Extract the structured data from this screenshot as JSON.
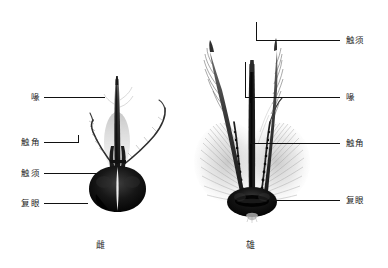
{
  "figure": {
    "type": "anatomical-comparison-diagram",
    "background_color": "#ffffff",
    "line_color": "#111111",
    "text_color": "#1c1c1c"
  },
  "female_panel": {
    "caption": "雌",
    "labels": [
      {
        "text": "喙",
        "meaning": "proboscis",
        "y": 97,
        "text_x": 14,
        "line_x1": 44,
        "line_x2": 105
      },
      {
        "text": "触角",
        "meaning": "antenna",
        "y": 142,
        "text_x": 8,
        "line_x1": 44,
        "line_x2": 78
      },
      {
        "text": "触须",
        "meaning": "palp",
        "y": 173,
        "text_x": 8,
        "line_x1": 44,
        "line_x2": 100
      },
      {
        "text": "复眼",
        "meaning": "compound eye",
        "y": 203,
        "text_x": 8,
        "line_x1": 44,
        "line_x2": 88
      }
    ]
  },
  "male_panel": {
    "caption": "雄",
    "labels": [
      {
        "text": "触须",
        "meaning": "palp",
        "y": 40,
        "text_x": 348,
        "line_x1": 256,
        "line_x2": 340
      },
      {
        "text": "喙",
        "meaning": "proboscis",
        "y": 97,
        "text_x": 348,
        "line_x1": 245,
        "line_x2": 340
      },
      {
        "text": "触角",
        "meaning": "antenna",
        "y": 143,
        "text_x": 348,
        "line_x1": 250,
        "line_x2": 340
      },
      {
        "text": "复眼",
        "meaning": "compound eye",
        "y": 200,
        "text_x": 348,
        "line_x1": 272,
        "line_x2": 340
      }
    ]
  }
}
